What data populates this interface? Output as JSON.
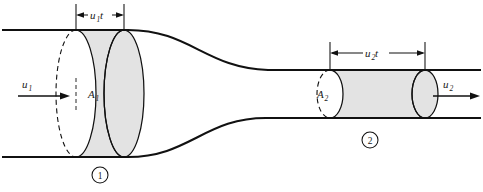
{
  "figure": {
    "kind": "fluid-continuity-nozzle-diagram",
    "background_color": "#ffffff",
    "line_color": "#111111",
    "slug_fill_color": "#e3e3e3"
  },
  "labels": {
    "inlet_velocity": "u",
    "inlet_velocity_sub": "1",
    "inlet_area": "A",
    "inlet_area_sub": "1",
    "outlet_velocity": "u",
    "outlet_velocity_sub": "2",
    "outlet_area": "A",
    "outlet_area_sub": "2",
    "inlet_slug_len": "u",
    "inlet_slug_len_sub": "1",
    "inlet_slug_len_tail": "t",
    "outlet_slug_len": "u",
    "outlet_slug_len_sub": "2",
    "outlet_slug_len_tail": "t",
    "station_one": "1",
    "station_two": "2"
  },
  "geometry": {
    "inlet_pipe_top_y": 30,
    "inlet_pipe_bottom_y": 157,
    "outlet_pipe_top_y": 70,
    "outlet_pipe_bottom_y": 118,
    "inlet_section_x": 76,
    "inlet_slug_end_x": 124,
    "outlet_section_x": 330,
    "outlet_slug_end_x": 425,
    "inlet_ellipse_rx": 20,
    "outlet_ellipse_rx": 13
  }
}
